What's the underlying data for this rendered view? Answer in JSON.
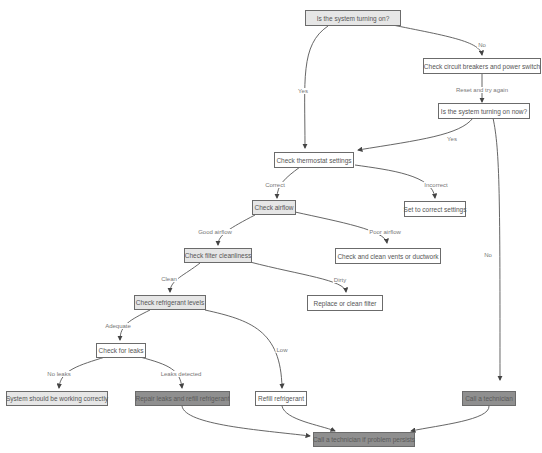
{
  "diagram": {
    "nodes": {
      "start": "Is the system turning on?",
      "check_breakers": "Check circuit breakers and power switch",
      "turning_on_now": "Is the system turning on now?",
      "thermostat": "Check thermostat settings",
      "set_correct": "Set to correct settings",
      "airflow": "Check airflow",
      "clean_vents": "Check and clean vents or ductwork",
      "filter": "Check filter cleanliness",
      "replace_filter": "Replace or clean filter",
      "refrigerant": "Check refrigerant levels",
      "leaks": "Check for leaks",
      "working": "System should be working correctly",
      "repair_leaks": "Repair leaks and refill refrigerant",
      "refill": "Refill refrigerant",
      "call_tech": "Call a technician",
      "call_tech_persist": "Call a technician if problem persists"
    },
    "edges": {
      "start_no": "No",
      "start_yes": "Yes",
      "reset": "Reset and try again",
      "now_yes": "Yes",
      "now_no": "No",
      "correct": "Correct",
      "incorrect": "Incorrect",
      "good_airflow": "Good airflow",
      "poor_airflow": "Poor airflow",
      "clean": "Clean",
      "dirty": "Dirty",
      "adequate": "Adequate",
      "low": "Low",
      "no_leaks": "No leaks",
      "leaks_detected": "Leaks detected"
    },
    "colors": {
      "plain_fill": "#ffffff",
      "highlight_fill": "#e6e6e6",
      "terminal_fill": "#8f8f8f",
      "edge": "#444444"
    }
  }
}
